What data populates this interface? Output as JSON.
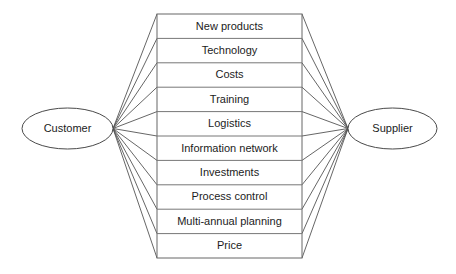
{
  "diagram": {
    "type": "fan-connection-diagram",
    "background_color": "#ffffff",
    "line_color": "#555555",
    "text_color": "#1c1c1c",
    "left_node": {
      "label": "Customer",
      "cx": 67.5,
      "cy": 128.5,
      "rx": 45.5,
      "ry": 20.5
    },
    "right_node": {
      "label": "Supplier",
      "cx": 392.5,
      "cy": 128.5,
      "rx": 44.5,
      "ry": 20.5
    },
    "table": {
      "x": 157,
      "y": 14,
      "width": 145,
      "height": 244,
      "rows": [
        {
          "label": "New products"
        },
        {
          "label": "Technology"
        },
        {
          "label": "Costs"
        },
        {
          "label": "Training"
        },
        {
          "label": "Logistics"
        },
        {
          "label": "Information network"
        },
        {
          "label": "Investments"
        },
        {
          "label": "Process control"
        },
        {
          "label": "Multi-annual planning"
        },
        {
          "label": "Price"
        }
      ]
    },
    "connectors": {
      "left_origin_x": 113,
      "left_origin_y": 128.5,
      "right_origin_x": 348,
      "right_origin_y": 128.5
    }
  }
}
